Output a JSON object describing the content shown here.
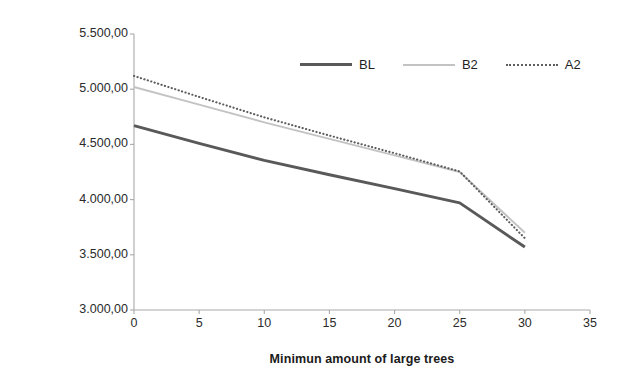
{
  "chart_data": {
    "type": "line",
    "title": "",
    "xlabel": "Minimun amount of large trees",
    "ylabel": "NPV of benefits over 150 years (€)",
    "x": [
      0,
      5,
      10,
      15,
      20,
      25,
      30
    ],
    "xlim": [
      0,
      35
    ],
    "ylim": [
      3000,
      5500
    ],
    "grid": false,
    "legend_position": "top-right-inside",
    "xticks": [
      0,
      5,
      10,
      15,
      20,
      25,
      30,
      35
    ],
    "xtick_labels": [
      "0",
      "5",
      "10",
      "15",
      "20",
      "25",
      "30",
      "35"
    ],
    "yticks": [
      3000,
      3500,
      4000,
      4500,
      5000,
      5500
    ],
    "ytick_labels": [
      "3.000,00",
      "3.500,00",
      "4.000,00",
      "4.500,00",
      "5.000,00",
      "5.500,00"
    ],
    "series": [
      {
        "name": "BL",
        "style": "solid-thick",
        "color": "#595959",
        "values": [
          4670,
          4510,
          4355,
          4225,
          4100,
          3970,
          3570
        ]
      },
      {
        "name": "B2",
        "style": "solid-thin",
        "color": "#c3c3c3",
        "values": [
          5020,
          4860,
          4700,
          4550,
          4400,
          4250,
          3700
        ]
      },
      {
        "name": "A2",
        "style": "dotted",
        "color": "#5d5d5d",
        "values": [
          5120,
          4930,
          4745,
          4580,
          4420,
          4255,
          3650
        ]
      }
    ]
  },
  "axes": {
    "y_title": "NPV of benefits over 150 years (€)",
    "x_title": "Minimun amount of large trees"
  },
  "legend": {
    "items": [
      {
        "label": "BL",
        "swatch": "line-solid-thick-dark"
      },
      {
        "label": "B2",
        "swatch": "line-solid-thin-light"
      },
      {
        "label": "A2",
        "swatch": "line-dotted-dark"
      }
    ]
  },
  "colors": {
    "background": "#ffffff",
    "axis": "#aaaaaa",
    "text": "#1a1a1a",
    "series_bl": "#595959",
    "series_b2": "#c3c3c3",
    "series_a2": "#5d5d5d"
  }
}
